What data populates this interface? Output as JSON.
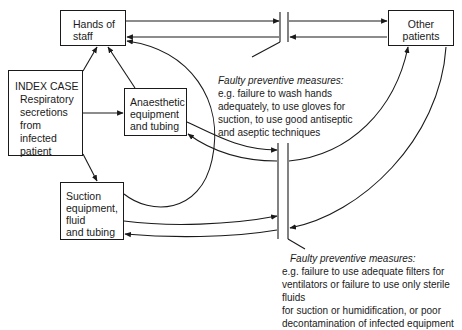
{
  "nodes": {
    "hands_of_staff": {
      "lines": [
        "Hands of",
        "staff"
      ]
    },
    "other_patients": {
      "lines": [
        "Other",
        "patients"
      ]
    },
    "index_case": {
      "title": "INDEX CASE",
      "lines": [
        "Respiratory",
        "secretions",
        "from",
        "infected",
        "patient"
      ]
    },
    "anaesthetic": {
      "lines": [
        "Anaesthetic",
        "equipment",
        "and tubing"
      ]
    },
    "suction": {
      "lines": [
        "Suction",
        "equipment,",
        "fluid",
        "and tubing"
      ]
    }
  },
  "barriers": {
    "upper": {
      "heading": "Faulty preventive measures:",
      "lines": [
        "e.g. failure to wash hands",
        "adequately, to use gloves for",
        "suction, to use good antiseptic",
        "and aseptic techniques"
      ]
    },
    "lower": {
      "heading": "Faulty preventive measures:",
      "lines": [
        "e.g. failure to use adequate filters for",
        "ventilators or failure to use only sterile fluids",
        "for suction or humidification, or poor",
        "decontamination of infected equipment"
      ]
    }
  },
  "colors": {
    "ink": "#1a1a1a",
    "background": "#ffffff"
  }
}
